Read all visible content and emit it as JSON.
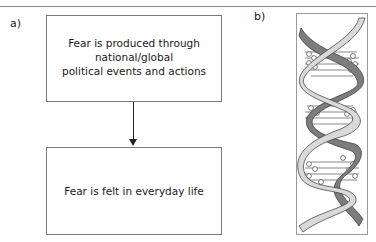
{
  "figure": {
    "panel_a": {
      "label": "a)",
      "boxes": [
        {
          "lines": [
            "Fear is produced through",
            "national/global",
            "political events and actions"
          ]
        },
        {
          "lines": [
            "Fear is felt in everyday life"
          ]
        }
      ],
      "connector": "arrow-down"
    },
    "panel_b": {
      "label": "b)",
      "image": "dna-double-helix-icon",
      "colors": {
        "strand_dark": "#7d7d7d",
        "strand_light": "#d9d9d9",
        "outline": "#333333",
        "frame": "#9a9a9a"
      }
    }
  }
}
